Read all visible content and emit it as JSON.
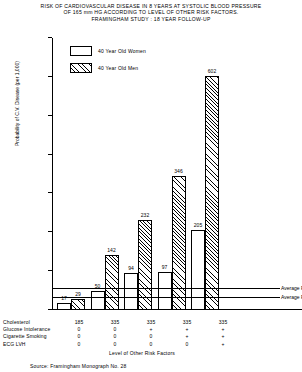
{
  "title": {
    "line1": "RISK OF CARDIOVASCULAR DISEASE IN 8 YEARS AT SYSTOLIC BLOOD PRESSURE",
    "line2": "OF 165 mm HG ACCORDING TO LEVEL OF OTHER RISK FACTORS.",
    "line3": "FRAMINGHAM STUDY : 18 YEAR FOLLOW-UP"
  },
  "legend": {
    "items": [
      {
        "label": "40 Year Old Women",
        "fill": "white"
      },
      {
        "label": "40 Year Old Men",
        "fill": "hatched"
      }
    ]
  },
  "annotations": {
    "average_risk_men": "Average Risk Men",
    "average_risk_women": "Average Risk Women"
  },
  "risk_table": {
    "rows": [
      {
        "label": "Cholesterol",
        "values": [
          "185",
          "335",
          "335",
          "335",
          "335"
        ]
      },
      {
        "label": "Glucose Intolerance",
        "values": [
          "0",
          "0",
          "+",
          "+",
          "+"
        ]
      },
      {
        "label": "Cigarette Smoking",
        "values": [
          "0",
          "0",
          "0",
          "+",
          "+"
        ]
      },
      {
        "label": "ECG   LVH",
        "values": [
          "0",
          "0",
          "0",
          "0",
          "+"
        ]
      }
    ]
  },
  "xaxis_title": "Level of Other Risk Factors",
  "source": "Source: Framingham Monograph No. 28",
  "chart_data": {
    "type": "bar",
    "title": "RISK OF CARDIOVASCULAR DISEASE IN 8 YEARS AT SYSTOLIC BLOOD PRESSURE OF 165 mm HG ACCORDING TO LEVEL OF OTHER RISK FACTORS. FRAMINGHAM STUDY : 18 YEAR FOLLOW-UP",
    "xlabel": "Level of Other Risk Factors",
    "ylabel": "Probability of C.V. Disease (per 1,000)",
    "ylim": [
      0,
      700
    ],
    "yticks": [
      0,
      100,
      200,
      300,
      400,
      500,
      600,
      700
    ],
    "ytick_labels": [
      "",
      "100",
      "200",
      "300",
      "400",
      "500",
      "600",
      "700"
    ],
    "grid": false,
    "legend_position": "upper-left-inside",
    "categories": [
      "1",
      "2",
      "3",
      "4",
      "5"
    ],
    "series": [
      {
        "name": "40 Year Old Women",
        "values": [
          17,
          50,
          94,
          97,
          205
        ]
      },
      {
        "name": "40 Year Old Men",
        "values": [
          29,
          142,
          232,
          346,
          602
        ]
      }
    ],
    "reference_lines": [
      {
        "label": "Average Risk Men",
        "value": 55
      },
      {
        "label": "Average Risk Women",
        "value": 32
      }
    ]
  }
}
